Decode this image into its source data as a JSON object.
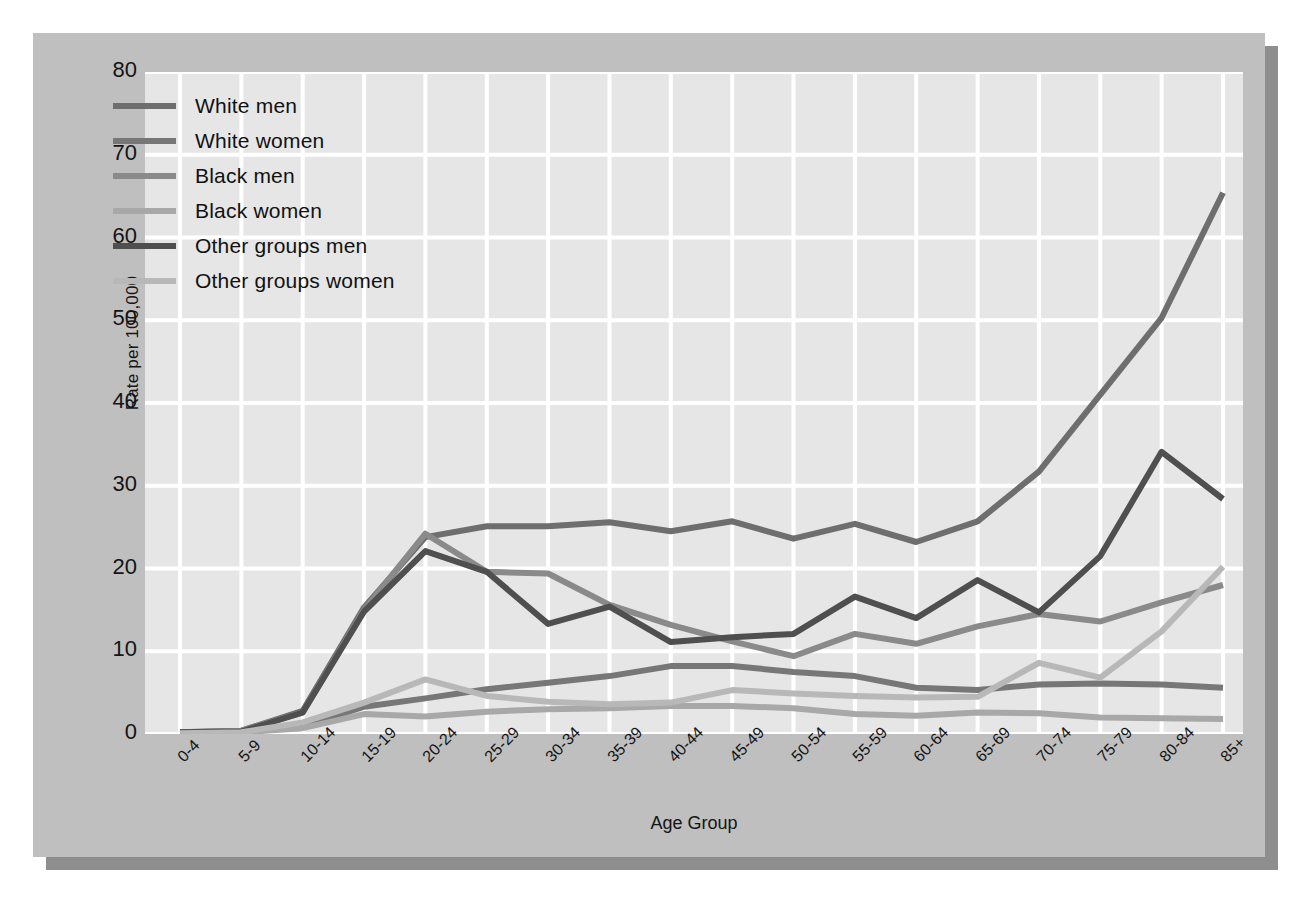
{
  "chart_data": {
    "type": "line",
    "title": "",
    "xlabel": "Age Group",
    "ylabel": "Rate per 100,000",
    "ylim": [
      0,
      80
    ],
    "yticks": [
      0,
      10,
      20,
      30,
      40,
      50,
      60,
      70,
      80
    ],
    "grid": true,
    "legend_position": "upper-left-inside",
    "categories": [
      "0-4",
      "5-9",
      "10-14",
      "15-19",
      "20-24",
      "25-29",
      "30-34",
      "35-39",
      "40-44",
      "45-49",
      "50-54",
      "55-59",
      "60-64",
      "65-69",
      "70-74",
      "75-79",
      "80-84",
      "85+"
    ],
    "series": [
      {
        "name": "White men",
        "color": "#6e6e6e",
        "values": [
          0.2,
          0.4,
          2.8,
          15.3,
          23.8,
          25.1,
          25.1,
          25.6,
          24.5,
          25.7,
          23.6,
          25.4,
          23.2,
          25.7,
          31.7,
          41.0,
          50.3,
          65.4
        ]
      },
      {
        "name": "White women",
        "color": "#777777",
        "values": [
          0.1,
          0.2,
          0.9,
          3.3,
          4.3,
          5.4,
          6.2,
          7.0,
          8.2,
          8.2,
          7.5,
          7.0,
          5.6,
          5.3,
          6.0,
          6.1,
          6.0,
          5.6
        ]
      },
      {
        "name": "Black men",
        "color": "#8a8a8a",
        "values": [
          0.2,
          0.4,
          2.6,
          15.0,
          24.2,
          19.6,
          19.4,
          15.6,
          13.2,
          11.2,
          9.4,
          12.1,
          10.9,
          13.0,
          14.5,
          13.6,
          15.9,
          18.0
        ]
      },
      {
        "name": "Black women",
        "color": "#a8a8a8",
        "values": [
          0.1,
          0.2,
          0.7,
          2.4,
          2.1,
          2.7,
          3.0,
          3.1,
          3.4,
          3.4,
          3.1,
          2.4,
          2.2,
          2.6,
          2.5,
          2.0,
          1.9,
          1.8
        ]
      },
      {
        "name": "Other groups men",
        "color": "#4f4f4f",
        "values": [
          0.2,
          0.3,
          2.6,
          14.8,
          22.1,
          19.6,
          13.3,
          15.4,
          11.1,
          11.7,
          12.1,
          16.6,
          14.0,
          18.6,
          14.7,
          21.5,
          34.1,
          28.4
        ]
      },
      {
        "name": "Other groups women",
        "color": "#b8b8b8",
        "values": [
          0.1,
          0.2,
          1.4,
          3.8,
          6.6,
          4.6,
          3.9,
          3.6,
          3.8,
          5.3,
          4.9,
          4.6,
          4.4,
          4.5,
          8.6,
          6.8,
          12.4,
          20.2
        ]
      }
    ]
  },
  "axes": {
    "y_title": "Rate per 100,000",
    "x_title": "Age Group"
  },
  "colors": {
    "page_background": "#ffffff",
    "panel_background": "#bfbfbf",
    "plot_background": "#e6e6e6",
    "gridline": "#ffffff",
    "shadow": "#8e8e8e",
    "text": "#141414"
  }
}
